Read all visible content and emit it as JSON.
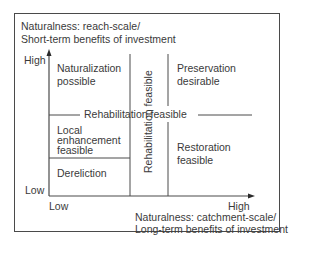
{
  "diagram": {
    "y_axis": {
      "title_line1": "Naturalness: reach-scale/",
      "title_line2": "Short-term benefits of investment",
      "high_label": "High",
      "low_label": "Low"
    },
    "x_axis": {
      "title_line1": "Naturalness: catchment-scale/",
      "title_line2": "Long-term benefits of investment",
      "low_label": "Low",
      "high_label": "High"
    },
    "regions": {
      "naturalization": {
        "line1": "Naturalization",
        "line2": "possible"
      },
      "preservation": {
        "line1": "Preservation",
        "line2": "desirable"
      },
      "local_enhancement": {
        "line1": "Local",
        "line2": "enhancement",
        "line3": "feasible"
      },
      "restoration": {
        "line1": "Restoration",
        "line2": "feasible"
      },
      "dereliction": {
        "line1": "Dereliction"
      }
    },
    "bands": {
      "horizontal": "Rehabilitation feasible",
      "vertical": "Rehabilitation feasible"
    },
    "colors": {
      "line": "#4a4a4a",
      "text": "#3a3a3a",
      "background": "#ffffff"
    }
  }
}
